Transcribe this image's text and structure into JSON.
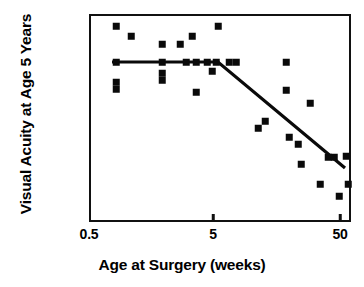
{
  "chart_data": {
    "type": "scatter",
    "title": "",
    "xlabel": "Age at Surgery (weeks)",
    "ylabel": "Visual Acuity at Age 5 Years",
    "xscale": "log",
    "yscale": "log",
    "grid": false,
    "legend": null,
    "xlim": [
      0.5,
      50
    ],
    "xticks": [
      {
        "label": "0.5",
        "value": 0.5,
        "px": 89
      },
      {
        "label": "5",
        "value": 5,
        "px": 213
      },
      {
        "label": "50",
        "value": 50,
        "px": 340
      }
    ],
    "yticks": [
      {
        "label": "20/20",
        "value": 20,
        "px": 26
      },
      {
        "label": "20/40",
        "value": 40,
        "px": 52
      },
      {
        "label": "20/100",
        "value": 100,
        "px": 103
      },
      {
        "label": "20/200",
        "value": 200,
        "px": 128
      },
      {
        "label": "20/400",
        "value": 400,
        "px": 157
      },
      {
        "label": "20/800",
        "value": 800,
        "px": 184
      }
    ],
    "marker": "filled-square",
    "marker_color": "#0a0a0a",
    "points": [
      {
        "x_weeks": 1.6,
        "acuity": 20,
        "px": 116,
        "py": 26
      },
      {
        "x_weeks": 1.6,
        "acuity": 43,
        "px": 116,
        "py": 62
      },
      {
        "x_weeks": 1.6,
        "acuity": 68,
        "px": 116,
        "py": 82
      },
      {
        "x_weeks": 1.6,
        "acuity": 80,
        "px": 116,
        "py": 89
      },
      {
        "x_weeks": 2.2,
        "acuity": 26,
        "px": 131,
        "py": 36
      },
      {
        "x_weeks": 3.1,
        "acuity": 31,
        "px": 162,
        "py": 44
      },
      {
        "x_weeks": 3.1,
        "acuity": 43,
        "px": 162,
        "py": 62
      },
      {
        "x_weeks": 3.1,
        "acuity": 55,
        "px": 162,
        "py": 73
      },
      {
        "x_weeks": 3.1,
        "acuity": 66,
        "px": 162,
        "py": 80
      },
      {
        "x_weeks": 4.0,
        "acuity": 31,
        "px": 180,
        "py": 44
      },
      {
        "x_weeks": 4.3,
        "acuity": 43,
        "px": 186,
        "py": 62
      },
      {
        "x_weeks": 4.6,
        "acuity": 26,
        "px": 192,
        "py": 36
      },
      {
        "x_weeks": 4.7,
        "acuity": 43,
        "px": 196,
        "py": 62
      },
      {
        "x_weeks": 4.7,
        "acuity": 90,
        "px": 196,
        "py": 92
      },
      {
        "x_weeks": 5.4,
        "acuity": 43,
        "px": 207,
        "py": 62
      },
      {
        "x_weeks": 5.4,
        "acuity": 20,
        "px": 218,
        "py": 26
      },
      {
        "x_weeks": 5.7,
        "acuity": 50,
        "px": 212,
        "py": 71
      },
      {
        "x_weeks": 6.2,
        "acuity": 43,
        "px": 216,
        "py": 62
      },
      {
        "x_weeks": 7.2,
        "acuity": 43,
        "px": 229,
        "py": 62
      },
      {
        "x_weeks": 7.8,
        "acuity": 43,
        "px": 236,
        "py": 62
      },
      {
        "x_weeks": 10.5,
        "acuity": 200,
        "px": 258,
        "py": 128
      },
      {
        "x_weeks": 11.8,
        "acuity": 160,
        "px": 265,
        "py": 121
      },
      {
        "x_weeks": 16.0,
        "acuity": 43,
        "px": 286,
        "py": 62
      },
      {
        "x_weeks": 16.0,
        "acuity": 82,
        "px": 286,
        "py": 90
      },
      {
        "x_weeks": 16.5,
        "acuity": 260,
        "px": 289,
        "py": 137
      },
      {
        "x_weeks": 19.5,
        "acuity": 300,
        "px": 298,
        "py": 144
      },
      {
        "x_weeks": 20.5,
        "acuity": 500,
        "px": 301,
        "py": 164
      },
      {
        "x_weeks": 24.0,
        "acuity": 100,
        "px": 310,
        "py": 103
      },
      {
        "x_weeks": 28.0,
        "acuity": 800,
        "px": 320,
        "py": 184
      },
      {
        "x_weeks": 33.0,
        "acuity": 400,
        "px": 328,
        "py": 157
      },
      {
        "x_weeks": 36.0,
        "acuity": 400,
        "px": 334,
        "py": 157
      },
      {
        "x_weeks": 41.0,
        "acuity": 1100,
        "px": 339,
        "py": 196
      },
      {
        "x_weeks": 48.0,
        "acuity": 400,
        "px": 346,
        "py": 156
      },
      {
        "x_weeks": 50.0,
        "acuity": 800,
        "px": 348,
        "py": 184
      }
    ],
    "trend_line": {
      "style": "piecewise-linear",
      "color": "#0a0a0a",
      "width_px": 3.2,
      "vertices": [
        {
          "px": 112,
          "py": 62
        },
        {
          "px": 218,
          "py": 62
        },
        {
          "px": 345,
          "py": 168
        }
      ],
      "description": "Flat through ~5 weeks at about 20/40, then declining sharply to about 20/400 by 50 weeks"
    }
  }
}
